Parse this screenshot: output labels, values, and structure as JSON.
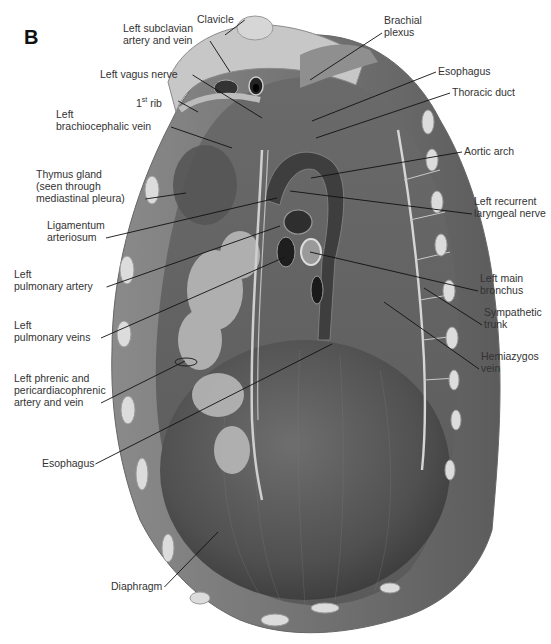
{
  "figure": {
    "panel_letter": "B",
    "labels": [
      {
        "id": "clavicle",
        "text": "Clavicle",
        "x": 197,
        "y": 13,
        "target": [
          225,
          35
        ]
      },
      {
        "id": "left-subclavian",
        "text": "Left subclavian\nartery and vein",
        "x": 123,
        "y": 22,
        "target": [
          230,
          72
        ]
      },
      {
        "id": "left-vagus",
        "text": "Left vagus nerve",
        "x": 100,
        "y": 68,
        "target": [
          262,
          118
        ]
      },
      {
        "id": "first-rib",
        "text": "1st rib",
        "x": 136,
        "y": 94,
        "target": [
          198,
          112
        ]
      },
      {
        "id": "left-brachiocephalic",
        "text": "Left\nbrachiocephalic vein",
        "x": 56,
        "y": 108,
        "target": [
          232,
          148
        ]
      },
      {
        "id": "thymus",
        "text": "Thymus gland\n(seen through\nmediastinal pleura)",
        "x": 36,
        "y": 168,
        "target": [
          186,
          193
        ]
      },
      {
        "id": "ligamentum",
        "text": "Ligamentum\narteriosum",
        "x": 47,
        "y": 219,
        "target": [
          277,
          198
        ]
      },
      {
        "id": "left-pulm-artery",
        "text": "Left\npulmonary artery",
        "x": 14,
        "y": 268,
        "target": [
          280,
          226
        ]
      },
      {
        "id": "left-pulm-veins",
        "text": "Left\npulmonary veins",
        "x": 14,
        "y": 319,
        "target": [
          285,
          257
        ]
      },
      {
        "id": "left-phrenic",
        "text": "Left phrenic and\npericardiacophrenic\nartery and vein",
        "x": 14,
        "y": 372,
        "target": [
          185,
          361
        ]
      },
      {
        "id": "esophagus-low",
        "text": "Esophagus",
        "x": 42,
        "y": 457,
        "target": [
          332,
          344
        ]
      },
      {
        "id": "diaphragm",
        "text": "Diaphragm",
        "x": 111,
        "y": 580,
        "target": [
          218,
          532
        ]
      },
      {
        "id": "brachial-plexus",
        "text": "Brachial\nplexus",
        "x": 384,
        "y": 14,
        "target": [
          310,
          80
        ]
      },
      {
        "id": "esophagus-up",
        "text": "Esophagus",
        "x": 438,
        "y": 65,
        "target": [
          312,
          121
        ]
      },
      {
        "id": "thoracic-duct",
        "text": "Thoracic duct",
        "x": 452,
        "y": 86,
        "target": [
          316,
          138
        ]
      },
      {
        "id": "aortic-arch",
        "text": "Aortic arch",
        "x": 464,
        "y": 145,
        "target": [
          311,
          178
        ]
      },
      {
        "id": "left-recurrent",
        "text": "Left recurrent\nlaryngeal nerve",
        "x": 474,
        "y": 195,
        "target": [
          290,
          191
        ]
      },
      {
        "id": "left-main-bronchus",
        "text": "Left main\nbronchus",
        "x": 480,
        "y": 272,
        "target": [
          310,
          252
        ]
      },
      {
        "id": "sympathetic-trunk",
        "text": "Sympathetic\ntrunk",
        "x": 484,
        "y": 306,
        "target": [
          424,
          288
        ]
      },
      {
        "id": "hemiazygos",
        "text": "Hemiazygos\nvein",
        "x": 481,
        "y": 350,
        "target": [
          384,
          302
        ]
      }
    ]
  },
  "colors": {
    "background": "#ffffff",
    "label_text": "#333333",
    "leader_line": "#111111",
    "muscle_dark": "#4a4a4a",
    "muscle_mid": "#6b6b6b",
    "pleura_light": "#a9a9a9",
    "bone": "#d8d8d8"
  }
}
